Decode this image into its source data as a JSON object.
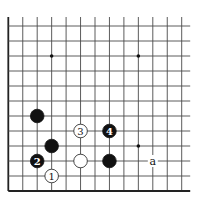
{
  "diagram": {
    "board": {
      "columns": 13,
      "rows": 12,
      "origin_x": 8.3,
      "origin_y": 26,
      "spacing_x": 14.45,
      "spacing_y": 15,
      "top_extension": 9,
      "right_extension": 8.5,
      "edges": [
        "left",
        "bottom"
      ],
      "line_color": "#4a4a4a",
      "edge_color": "#222222"
    },
    "star_points": [
      {
        "col": 3,
        "row": 2
      },
      {
        "col": 9,
        "row": 2
      },
      {
        "col": 9,
        "row": 8
      }
    ],
    "stones": [
      {
        "color": "black",
        "col": 2,
        "row": 6,
        "label": ""
      },
      {
        "color": "black",
        "col": 3,
        "row": 8,
        "label": ""
      },
      {
        "color": "black",
        "col": 2,
        "row": 9,
        "label": "2"
      },
      {
        "color": "white",
        "col": 3,
        "row": 10,
        "label": "1"
      },
      {
        "color": "white",
        "col": 5,
        "row": 7,
        "label": "3"
      },
      {
        "color": "black",
        "col": 7,
        "row": 7,
        "label": "4"
      },
      {
        "color": "white",
        "col": 5,
        "row": 9,
        "label": ""
      },
      {
        "color": "black",
        "col": 7,
        "row": 9,
        "label": ""
      }
    ],
    "markers": [
      {
        "col": 10,
        "row": 9,
        "text": "a"
      }
    ],
    "stone_radius": 6.8,
    "colors": {
      "black_stone": "#111111",
      "white_stone": "#ffffff",
      "background": "#ffffff"
    }
  }
}
